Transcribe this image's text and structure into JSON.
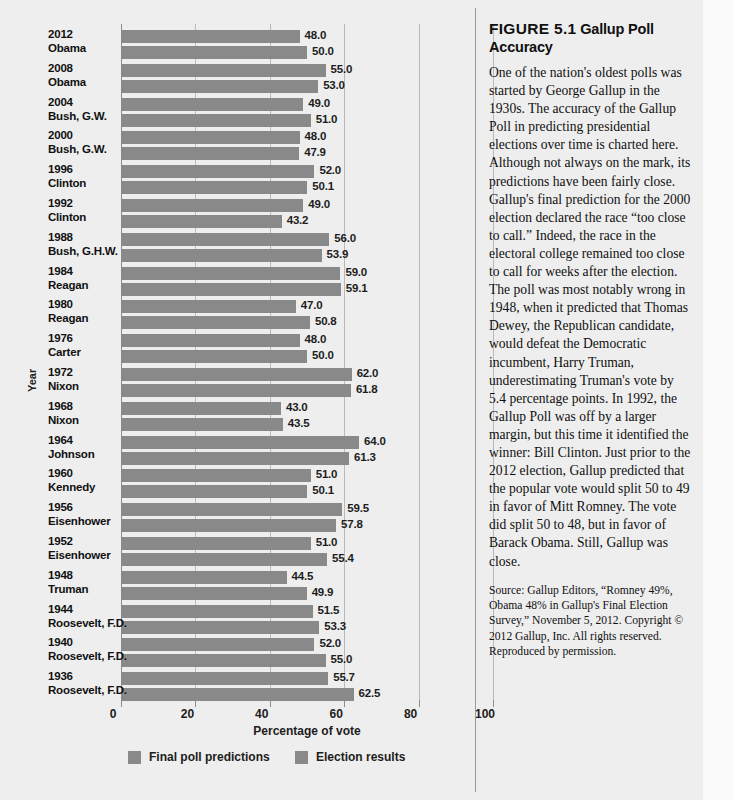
{
  "figure": {
    "label": "FIGURE 5.1",
    "title": "Gallup Poll Accuracy",
    "body": "One of the nation's oldest polls was started by George Gallup in the 1930s. The accuracy of the Gallup Poll in predicting presidential elections over time is charted here. Although not always on the mark, its predictions have been fairly close. Gallup's final prediction for the 2000 election declared the race “too close to call.” Indeed, the race in the electoral college remained too close to call for weeks after the election. The poll was most notably wrong in 1948, when it predicted that Thomas Dewey, the Republican candidate, would defeat the Democratic incumbent, Harry Truman, underestimating Truman's vote by 5.4 percentage points. In 1992, the Gallup Poll was off by a larger margin, but this time it identified the winner: Bill Clinton. Just prior to the 2012 election, Gallup predicted that the popular vote would split 50 to 49 in favor of Mitt Romney. The vote did split 50 to 48, but in favor of Barack Obama. Still, Gallup was close.",
    "source": "Source: Gallup Editors, “Romney 49%, Obama 48% in Gallup's Final Election Survey,” November 5, 2012. Copyright © 2012 Gallup, Inc. All rights reserved. Reproduced by permission."
  },
  "chart_data": {
    "type": "bar",
    "orientation": "horizontal",
    "title": "Gallup Poll Accuracy",
    "xlabel": "Percentage of vote",
    "ylabel": "Year",
    "xlim": [
      0,
      100
    ],
    "xticks": [
      0,
      20,
      40,
      60,
      80,
      100
    ],
    "grid": true,
    "legend_position": "bottom",
    "bar_color": "#898989",
    "categories": [
      "2012 Obama",
      "2008 Obama",
      "2004 Bush, G.W.",
      "2000 Bush, G.W.",
      "1996 Clinton",
      "1992 Clinton",
      "1988 Bush, G.H.W.",
      "1984 Reagan",
      "1980 Reagan",
      "1976 Carter",
      "1972 Nixon",
      "1968 Nixon",
      "1964 Johnson",
      "1960 Kennedy",
      "1956 Eisenhower",
      "1952 Eisenhower",
      "1948 Truman",
      "1944 Roosevelt, F.D.",
      "1940 Roosevelt, F.D.",
      "1936 Roosevelt, F.D."
    ],
    "series": [
      {
        "name": "Final poll predictions",
        "values": [
          48.0,
          55.0,
          49.0,
          48.0,
          52.0,
          49.0,
          56.0,
          59.0,
          47.0,
          48.0,
          62.0,
          43.0,
          64.0,
          51.0,
          59.5,
          51.0,
          44.5,
          51.5,
          52.0,
          55.7
        ]
      },
      {
        "name": "Election results",
        "values": [
          50.0,
          53.0,
          51.0,
          47.9,
          50.1,
          43.2,
          53.9,
          59.1,
          50.8,
          50.0,
          61.8,
          43.5,
          61.3,
          50.1,
          57.8,
          55.4,
          49.9,
          53.3,
          55.0,
          62.5
        ]
      }
    ],
    "rows": [
      {
        "year": "2012",
        "name": "Obama",
        "prediction": "48.0",
        "result": "50.0"
      },
      {
        "year": "2008",
        "name": "Obama",
        "prediction": "55.0",
        "result": "53.0"
      },
      {
        "year": "2004",
        "name": "Bush, G.W.",
        "prediction": "49.0",
        "result": "51.0"
      },
      {
        "year": "2000",
        "name": "Bush, G.W.",
        "prediction": "48.0",
        "result": "47.9"
      },
      {
        "year": "1996",
        "name": "Clinton",
        "prediction": "52.0",
        "result": "50.1"
      },
      {
        "year": "1992",
        "name": "Clinton",
        "prediction": "49.0",
        "result": "43.2"
      },
      {
        "year": "1988",
        "name": "Bush, G.H.W.",
        "prediction": "56.0",
        "result": "53.9"
      },
      {
        "year": "1984",
        "name": "Reagan",
        "prediction": "59.0",
        "result": "59.1"
      },
      {
        "year": "1980",
        "name": "Reagan",
        "prediction": "47.0",
        "result": "50.8"
      },
      {
        "year": "1976",
        "name": "Carter",
        "prediction": "48.0",
        "result": "50.0"
      },
      {
        "year": "1972",
        "name": "Nixon",
        "prediction": "62.0",
        "result": "61.8"
      },
      {
        "year": "1968",
        "name": "Nixon",
        "prediction": "43.0",
        "result": "43.5"
      },
      {
        "year": "1964",
        "name": "Johnson",
        "prediction": "64.0",
        "result": "61.3"
      },
      {
        "year": "1960",
        "name": "Kennedy",
        "prediction": "51.0",
        "result": "50.1"
      },
      {
        "year": "1956",
        "name": "Eisenhower",
        "prediction": "59.5",
        "result": "57.8"
      },
      {
        "year": "1952",
        "name": "Eisenhower",
        "prediction": "51.0",
        "result": "55.4"
      },
      {
        "year": "1948",
        "name": "Truman",
        "prediction": "44.5",
        "result": "49.9"
      },
      {
        "year": "1944",
        "name": "Roosevelt, F.D.",
        "prediction": "51.5",
        "result": "53.3"
      },
      {
        "year": "1940",
        "name": "Roosevelt, F.D.",
        "prediction": "52.0",
        "result": "55.0"
      },
      {
        "year": "1936",
        "name": "Roosevelt, F.D.",
        "prediction": "55.7",
        "result": "62.5"
      }
    ]
  }
}
